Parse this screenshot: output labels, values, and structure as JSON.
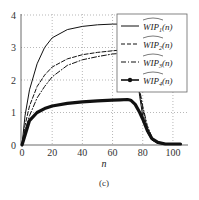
{
  "chart_data": {
    "type": "line",
    "title": "",
    "caption": "(c)",
    "xlabel": "n",
    "ylabel": "",
    "xlim": [
      0,
      110
    ],
    "ylim": [
      0,
      4
    ],
    "xticks": [
      0,
      20,
      40,
      60,
      80,
      100
    ],
    "yticks": [
      0,
      1,
      2,
      3,
      4
    ],
    "grid": true,
    "legend_position": "upper right",
    "x": [
      0,
      2,
      5,
      10,
      15,
      20,
      30,
      40,
      50,
      60,
      65,
      70,
      72,
      75,
      78,
      80,
      83,
      86,
      90,
      95,
      100,
      105
    ],
    "series": [
      {
        "name": "WIP̂1(n)",
        "style": "solid",
        "values": [
          0,
          0.9,
          1.7,
          2.5,
          3.0,
          3.3,
          3.55,
          3.65,
          3.7,
          3.72,
          3.72,
          3.7,
          3.5,
          2.6,
          1.5,
          0.9,
          0.4,
          0.15,
          0.05,
          0.02,
          0.02,
          0.02
        ]
      },
      {
        "name": "WIP̂2(n)",
        "style": "dashed",
        "values": [
          0,
          0.6,
          1.2,
          1.8,
          2.15,
          2.4,
          2.65,
          2.78,
          2.85,
          2.9,
          2.92,
          2.92,
          2.8,
          2.3,
          1.6,
          1.1,
          0.5,
          0.2,
          0.06,
          0.02,
          0.02,
          0.02
        ]
      },
      {
        "name": "WIP̂3(n)",
        "style": "dashdot",
        "values": [
          0,
          0.45,
          0.9,
          1.45,
          1.8,
          2.1,
          2.45,
          2.62,
          2.72,
          2.8,
          2.82,
          2.84,
          2.75,
          2.35,
          1.7,
          1.2,
          0.6,
          0.25,
          0.07,
          0.02,
          0.02,
          0.02
        ]
      },
      {
        "name": "WIP̂4(n)",
        "style": "thick-marker",
        "values": [
          0,
          0.3,
          0.75,
          1.0,
          1.12,
          1.2,
          1.28,
          1.33,
          1.36,
          1.38,
          1.39,
          1.4,
          1.38,
          1.25,
          1.0,
          0.8,
          0.45,
          0.2,
          0.08,
          0.03,
          0.03,
          0.03
        ]
      }
    ]
  },
  "legend": {
    "items": [
      {
        "label": "WIP",
        "sub": "1",
        "suffix": "(n)"
      },
      {
        "label": "WIP",
        "sub": "2",
        "suffix": "(n)"
      },
      {
        "label": "WIP",
        "sub": "3",
        "suffix": "(n)"
      },
      {
        "label": "WIP",
        "sub": "4",
        "suffix": "(n)"
      }
    ]
  }
}
